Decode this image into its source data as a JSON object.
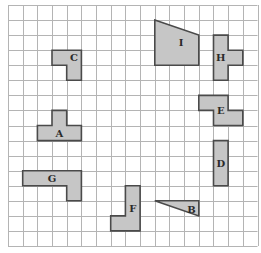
{
  "diagram": {
    "grid": {
      "columns": 17,
      "rows": 16
    },
    "colors": {
      "shape_fill": "#c6c6c6",
      "shape_stroke": "#4a4a4a",
      "grid_line": "#b4b4b4"
    },
    "shapes": [
      {
        "label": "I",
        "type": "polygon",
        "vertices": [
          [
            10,
            1
          ],
          [
            13,
            2
          ],
          [
            13,
            4
          ],
          [
            10,
            4
          ]
        ],
        "label_cell": [
          11.8,
          2.5
        ]
      },
      {
        "label": "H",
        "type": "polygon",
        "vertices": [
          [
            14,
            2
          ],
          [
            15,
            2
          ],
          [
            15,
            3
          ],
          [
            16,
            3
          ],
          [
            16,
            4
          ],
          [
            15,
            4
          ],
          [
            15,
            5
          ],
          [
            14,
            5
          ]
        ],
        "label_cell": [
          14.5,
          3.5
        ]
      },
      {
        "label": "C",
        "type": "polygon",
        "vertices": [
          [
            3,
            3
          ],
          [
            5,
            3
          ],
          [
            5,
            5
          ],
          [
            4,
            5
          ],
          [
            4,
            4
          ],
          [
            3,
            4
          ]
        ],
        "label_cell": [
          4.5,
          3.5
        ]
      },
      {
        "label": "E",
        "type": "polygon",
        "vertices": [
          [
            13,
            6
          ],
          [
            15,
            6
          ],
          [
            15,
            7
          ],
          [
            16,
            7
          ],
          [
            16,
            8
          ],
          [
            14,
            8
          ],
          [
            14,
            7
          ],
          [
            13,
            7
          ]
        ],
        "label_cell": [
          14.5,
          7.0
        ]
      },
      {
        "label": "A",
        "type": "polygon",
        "vertices": [
          [
            3,
            7
          ],
          [
            4,
            7
          ],
          [
            4,
            8
          ],
          [
            5,
            8
          ],
          [
            5,
            9
          ],
          [
            2,
            9
          ],
          [
            2,
            8
          ],
          [
            3,
            8
          ]
        ],
        "label_cell": [
          3.5,
          8.5
        ]
      },
      {
        "label": "D",
        "type": "polygon",
        "vertices": [
          [
            14,
            9
          ],
          [
            15,
            9
          ],
          [
            15,
            12
          ],
          [
            14,
            12
          ]
        ],
        "label_cell": [
          14.5,
          10.5
        ]
      },
      {
        "label": "G",
        "type": "polygon",
        "vertices": [
          [
            1,
            11
          ],
          [
            5,
            11
          ],
          [
            5,
            13
          ],
          [
            4,
            13
          ],
          [
            4,
            12
          ],
          [
            1,
            12
          ]
        ],
        "label_cell": [
          3.0,
          11.5
        ]
      },
      {
        "label": "F",
        "type": "polygon",
        "vertices": [
          [
            8,
            12
          ],
          [
            9,
            12
          ],
          [
            9,
            15
          ],
          [
            7,
            15
          ],
          [
            7,
            14
          ],
          [
            8,
            14
          ]
        ],
        "label_cell": [
          8.5,
          13.5
        ]
      },
      {
        "label": "B",
        "type": "triangle",
        "vertices": [
          [
            10,
            13
          ],
          [
            13,
            13
          ],
          [
            13,
            14
          ]
        ],
        "label_cell": [
          12.5,
          13.55
        ]
      }
    ]
  }
}
